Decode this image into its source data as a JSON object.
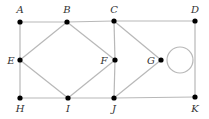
{
  "diagram": {
    "type": "graph",
    "nodes": [
      {
        "id": "A",
        "x": 20,
        "y": 22,
        "lx": 20,
        "ly": 13
      },
      {
        "id": "B",
        "x": 67,
        "y": 22,
        "lx": 67,
        "ly": 13
      },
      {
        "id": "C",
        "x": 114,
        "y": 21,
        "lx": 114,
        "ly": 13
      },
      {
        "id": "D",
        "x": 195,
        "y": 21,
        "lx": 195,
        "ly": 13
      },
      {
        "id": "E",
        "x": 20,
        "y": 60,
        "lx": 11,
        "ly": 64
      },
      {
        "id": "F",
        "x": 115,
        "y": 60,
        "lx": 104,
        "ly": 64
      },
      {
        "id": "G",
        "x": 161,
        "y": 60,
        "lx": 151,
        "ly": 64
      },
      {
        "id": "H",
        "x": 20,
        "y": 98,
        "lx": 20,
        "ly": 112
      },
      {
        "id": "I",
        "x": 68,
        "y": 98,
        "lx": 68,
        "ly": 112
      },
      {
        "id": "J",
        "x": 114,
        "y": 98,
        "lx": 114,
        "ly": 112
      },
      {
        "id": "K",
        "x": 195,
        "y": 97,
        "lx": 195,
        "ly": 112
      }
    ],
    "edges": [
      [
        "A",
        "B"
      ],
      [
        "B",
        "C"
      ],
      [
        "C",
        "D"
      ],
      [
        "A",
        "E"
      ],
      [
        "E",
        "H"
      ],
      [
        "H",
        "I"
      ],
      [
        "I",
        "J"
      ],
      [
        "J",
        "K"
      ],
      [
        "D",
        "K"
      ],
      [
        "B",
        "E"
      ],
      [
        "E",
        "I"
      ],
      [
        "B",
        "F"
      ],
      [
        "F",
        "I"
      ],
      [
        "C",
        "F"
      ],
      [
        "F",
        "J"
      ],
      [
        "C",
        "G"
      ],
      [
        "G",
        "J"
      ]
    ],
    "loops": [
      {
        "node": "G",
        "cx": 180,
        "cy": 60,
        "r": 13
      }
    ]
  }
}
